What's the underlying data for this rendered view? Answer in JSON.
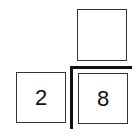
{
  "diagram": {
    "type": "long-division-setup",
    "quotient_box": "",
    "divisor_box": "2",
    "dividend_box": "8"
  }
}
